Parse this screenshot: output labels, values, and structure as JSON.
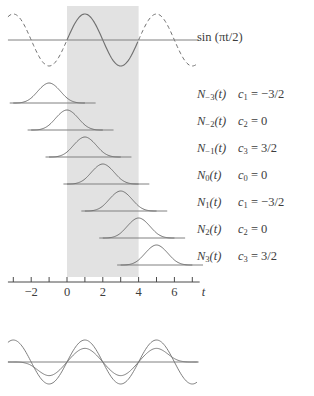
{
  "figure": {
    "title_label": "sin (πt/2)",
    "axis": {
      "variable": "t",
      "tick_values": [
        -3,
        -2,
        -1,
        0,
        1,
        2,
        3,
        4,
        5,
        6,
        7
      ],
      "labeled_ticks": [
        {
          "value": -2,
          "text": "−2"
        },
        {
          "value": 0,
          "text": "0"
        },
        {
          "value": 2,
          "text": "2"
        },
        {
          "value": 4,
          "text": "4"
        },
        {
          "value": 6,
          "text": "6"
        }
      ],
      "range": [
        -3.3,
        7.3
      ]
    },
    "shaded_band": {
      "from": 0,
      "to": 4,
      "color": "#e2e2e2"
    },
    "curve_color": "#707070",
    "axis_color": "#808080",
    "rows": [
      {
        "name_base": "N",
        "name_sub": "−3",
        "name_arg": "(t)",
        "coef_base": "c",
        "coef_sub": "1",
        "coef_eq": "= −3/2",
        "peak_t": -1,
        "coef_value": -1.5
      },
      {
        "name_base": "N",
        "name_sub": "−2",
        "name_arg": "(t)",
        "coef_base": "c",
        "coef_sub": "2",
        "coef_eq": "= 0",
        "peak_t": 0,
        "coef_value": 0
      },
      {
        "name_base": "N",
        "name_sub": "−1",
        "name_arg": "(t)",
        "coef_base": "c",
        "coef_sub": "3",
        "coef_eq": "= 3/2",
        "peak_t": 1,
        "coef_value": 1.5
      },
      {
        "name_base": "N",
        "name_sub": "0",
        "name_arg": "(t)",
        "coef_base": "c",
        "coef_sub": "0",
        "coef_eq": "= 0",
        "peak_t": 2,
        "coef_value": 0
      },
      {
        "name_base": "N",
        "name_sub": "1",
        "name_arg": "(t)",
        "coef_base": "c",
        "coef_sub": "1",
        "coef_eq": "= −3/2",
        "peak_t": 3,
        "coef_value": -1.5
      },
      {
        "name_base": "N",
        "name_sub": "2",
        "name_arg": "(t)",
        "coef_base": "c",
        "coef_sub": "2",
        "coef_eq": "= 0",
        "peak_t": 4,
        "coef_value": 0
      },
      {
        "name_base": "N",
        "name_sub": "3",
        "name_arg": "(t)",
        "coef_base": "c",
        "coef_sub": "3",
        "coef_eq": "= 3/2",
        "peak_t": 5,
        "coef_value": 1.5
      }
    ]
  },
  "chart_data": {
    "type": "line",
    "title": "sin (πt/2)",
    "xlabel": "t",
    "ylabel": "",
    "xlim": [
      -3.3,
      7.3
    ],
    "grid": false,
    "legend": "none",
    "annotations": [
      "sin (πt/2)",
      "N−3(t)  c1 = −3/2",
      "N−2(t)  c2 = 0",
      "N−1(t)  c3 = 3/2",
      "N0(t)  c0 = 0",
      "N1(t)  c1 = −3/2",
      "N2(t)  c2 = 0",
      "N3(t)  c3 = 3/2"
    ],
    "series": [
      {
        "name": "sin(pi*t/2)",
        "style": "solid-inside-band-dashed-outside",
        "x": [
          -3.3,
          -3,
          -2.5,
          -2,
          -1.5,
          -1,
          -0.5,
          0,
          0.5,
          1,
          1.5,
          2,
          2.5,
          3,
          3.5,
          4,
          4.5,
          5,
          5.5,
          6,
          6.5,
          7,
          7.3
        ],
        "values": [
          0.454,
          0.707,
          0.924,
          1.0,
          0.924,
          0.707,
          0.383,
          0.0,
          -0.383,
          -0.707,
          -0.924,
          -1.0,
          -0.924,
          -0.707,
          -0.383,
          0.0,
          0.383,
          0.707,
          0.924,
          1.0,
          0.924,
          0.707,
          0.454
        ]
      },
      {
        "name": "B-spline basis peaks",
        "style": "cubic-b-spline",
        "categories": [
          "N-3",
          "N-2",
          "N-1",
          "N0",
          "N1",
          "N2",
          "N3"
        ],
        "x": [
          -1,
          0,
          1,
          2,
          3,
          4,
          5
        ],
        "values": [
          1,
          1,
          1,
          1,
          1,
          1,
          1
        ],
        "support_width": 4
      },
      {
        "name": "spline approximation (bottom panel)",
        "style": "overlay-with-sine",
        "coefficients": [
          -1.5,
          0,
          1.5,
          0,
          -1.5,
          0,
          1.5
        ]
      }
    ]
  }
}
